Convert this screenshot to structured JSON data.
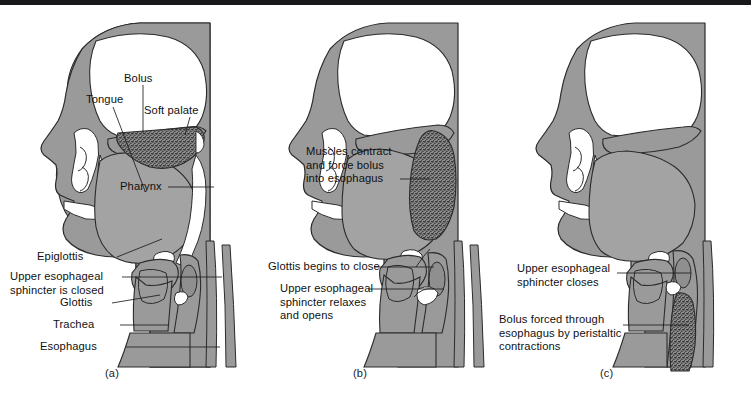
{
  "figure": {
    "panel_count": 3,
    "colors": {
      "tissue_fill": "#9a9a9a",
      "tissue_outline": "#2b2b2b",
      "cavity_fill": "#ffffff",
      "bolus_fill": "#4a4a4a",
      "label_text": "#111111",
      "top_rule": "#18181a",
      "background": "#ffffff"
    }
  },
  "panels": [
    {
      "id": "a",
      "caption": "(a)",
      "stage_name": "Oral phase — bolus in mouth, airway closed",
      "labels": [
        {
          "name": "bolus",
          "text": "Bolus"
        },
        {
          "name": "tongue",
          "text": "Tongue"
        },
        {
          "name": "soft-palate",
          "text": "Soft palate"
        },
        {
          "name": "pharynx",
          "text": "Pharynx"
        },
        {
          "name": "epiglottis",
          "text": "Epiglottis"
        },
        {
          "name": "upper-esophageal-sphincter",
          "text": "Upper esophageal\nsphincter is closed"
        },
        {
          "name": "glottis",
          "text": "Glottis"
        },
        {
          "name": "trachea",
          "text": "Trachea"
        },
        {
          "name": "esophagus",
          "text": "Esophagus"
        }
      ]
    },
    {
      "id": "b",
      "caption": "(b)",
      "stage_name": "Pharyngeal phase — bolus propelled into esophagus",
      "labels": [
        {
          "name": "muscles-contract",
          "text": "Muscles contract\nand force bolus\ninto esophagus"
        },
        {
          "name": "glottis-begins-to-close",
          "text": "Glottis begins to close"
        },
        {
          "name": "upper-esophageal-sphincter",
          "text": "Upper esophageal\nsphincter relaxes\nand opens"
        }
      ]
    },
    {
      "id": "c",
      "caption": "(c)",
      "stage_name": "Esophageal phase — peristalsis moves bolus down",
      "labels": [
        {
          "name": "upper-esophageal-sphincter",
          "text": "Upper esophageal\nsphincter closes"
        },
        {
          "name": "bolus-forced-through",
          "text": "Bolus forced through\nesophagus by peristaltic\ncontractions"
        }
      ]
    }
  ]
}
